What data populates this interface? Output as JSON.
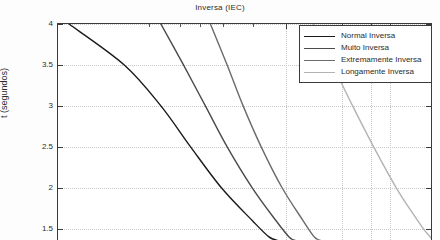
{
  "chart_data": {
    "type": "line",
    "title": "Inversa (IEC)",
    "xlabel": "",
    "ylabel": "t (segundos)",
    "xscale": "log",
    "yscale": "linear",
    "ylim": [
      1.35,
      4
    ],
    "ytick_labels": [
      "4",
      "3.5",
      "3",
      "2.5",
      "2",
      "1.5"
    ],
    "ytick_values": [
      4,
      3.5,
      3,
      2.5,
      2,
      1.5
    ],
    "xtick_labels": [],
    "grid": true,
    "legend_position": "upper right",
    "series": [
      {
        "name": "Normal Inversa",
        "color": "#1a1a1a",
        "points": [
          [
            0.012,
            4.0
          ],
          [
            0.03,
            3.5
          ],
          [
            0.055,
            3.0
          ],
          [
            0.09,
            2.5
          ],
          [
            0.15,
            2.0
          ],
          [
            0.25,
            1.6
          ],
          [
            0.33,
            1.4
          ],
          [
            0.39,
            1.35
          ]
        ]
      },
      {
        "name": "Muito Inversa",
        "color": "#4a4a4a",
        "points": [
          [
            0.055,
            4.0
          ],
          [
            0.08,
            3.5
          ],
          [
            0.115,
            3.0
          ],
          [
            0.165,
            2.5
          ],
          [
            0.25,
            2.0
          ],
          [
            0.37,
            1.6
          ],
          [
            0.46,
            1.4
          ],
          [
            0.52,
            1.35
          ]
        ]
      },
      {
        "name": "Extremamente Inversa",
        "color": "#6b6b6b",
        "points": [
          [
            0.125,
            4.0
          ],
          [
            0.165,
            3.5
          ],
          [
            0.215,
            3.0
          ],
          [
            0.29,
            2.5
          ],
          [
            0.41,
            2.0
          ],
          [
            0.58,
            1.6
          ],
          [
            0.7,
            1.4
          ],
          [
            0.79,
            1.35
          ]
        ]
      },
      {
        "name": "Longamente Inversa",
        "color": "#b3b3b3",
        "points": [
          [
            0.69,
            4.0
          ],
          [
            0.95,
            3.5
          ],
          [
            1.32,
            3.0
          ],
          [
            1.87,
            2.5
          ],
          [
            2.72,
            2.0
          ],
          [
            3.7,
            1.65
          ],
          [
            4.35,
            1.48
          ],
          [
            4.9,
            1.38
          ],
          [
            5.0,
            1.36
          ]
        ]
      }
    ],
    "vertical_gridlines": [
      0.44,
      1.11,
      1.78,
      2.47
    ],
    "xtick_minor": [
      0.045,
      0.075,
      0.105,
      0.155,
      0.255
    ],
    "colors": {
      "axis": "#3a3a3a",
      "grid": "#c9c9c9",
      "background": "#ffffff",
      "text": "#2b2b2b"
    }
  }
}
